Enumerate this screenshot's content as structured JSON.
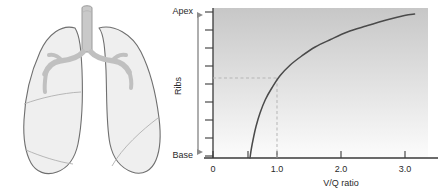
{
  "figure": {
    "background_color": "#ffffff"
  },
  "illustration": {
    "name": "lungs-diagram",
    "description": "Anterior view of lungs with trachea and main bronchi",
    "outline_color": "#6e6e6e",
    "fill_color": "#eeeeee",
    "airway_color": "#c9c9c9",
    "airway_outline_color": "#9a9a9a"
  },
  "chart_axis_arrow": {
    "top_label": "Apex",
    "middle_label": "Ribs",
    "bottom_label": "Base",
    "arrow_color": "#8c8c8c",
    "tick_count": 9
  },
  "chart_data": {
    "type": "line",
    "title": "",
    "xlabel": "V/Q ratio",
    "ylabel": "Ribs",
    "ylabel_top": "Apex",
    "ylabel_bottom": "Base",
    "xlim": [
      0,
      3.2
    ],
    "ylim": [
      0,
      1
    ],
    "xticks": [
      0,
      0.55,
      1.0,
      2.0,
      3.0
    ],
    "xtick_labels": [
      "0",
      "",
      "1.0",
      "2.0",
      "3.0"
    ],
    "grid": false,
    "legend": null,
    "curve_color": "#4a4a4a",
    "plot_gradient_top": "#c9c9c9",
    "plot_gradient_bottom": "#fbfbfb",
    "series": [
      {
        "name": "V/Q ratio from base to apex",
        "x": [
          0.55,
          0.57,
          0.6,
          0.64,
          0.7,
          0.78,
          0.88,
          1.0,
          1.15,
          1.32,
          1.52,
          1.75,
          2.0,
          2.28,
          2.58,
          2.85,
          3.0
        ],
        "y": [
          0.0,
          0.06,
          0.13,
          0.21,
          0.3,
          0.39,
          0.47,
          0.55,
          0.62,
          0.68,
          0.74,
          0.79,
          0.84,
          0.88,
          0.92,
          0.95,
          0.96
        ]
      }
    ],
    "annotations": [
      {
        "name": "reference-lines",
        "kind": "dashed-crosshair",
        "x": 1.0,
        "y": 0.55,
        "color": "#b5b5b5",
        "note": "Dashed lines mark V/Q = 1.0 at mid-lung level"
      }
    ]
  }
}
